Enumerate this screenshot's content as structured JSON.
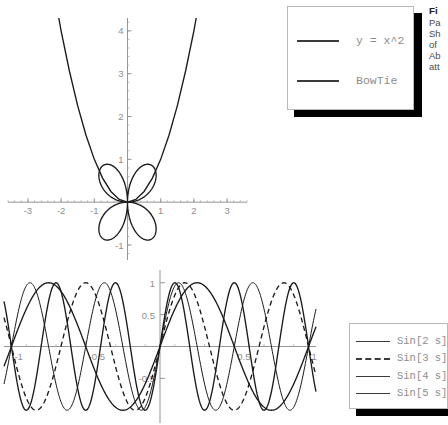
{
  "document": {
    "background_color": "#ffffff",
    "axis_color": "#8a8a8a",
    "curve_color": "#1a1a1a",
    "label_color": "#8d8d8d"
  },
  "caption": {
    "title": "Fi",
    "lines": [
      "Pa",
      "Sh",
      "of",
      "Ab",
      "att"
    ]
  },
  "legends": {
    "top": {
      "entries": [
        {
          "label": "y = x^2",
          "style": "solid"
        },
        {
          "label": "BowTie",
          "style": "solid"
        }
      ]
    },
    "bottom": {
      "entries": [
        {
          "label": "Sin[2 s]",
          "style": "solid"
        },
        {
          "label": "Sin[3 s]",
          "style": "dashed"
        },
        {
          "label": "Sin[4 s]",
          "style": "thin"
        },
        {
          "label": "Sin[5 s]",
          "style": "solid"
        }
      ]
    }
  },
  "chart_data": [
    {
      "id": "plot-parabola-bowtie",
      "type": "line",
      "title": "",
      "xlabel": "",
      "ylabel": "",
      "xlim": [
        -3.6,
        3.6
      ],
      "ylim": [
        -1.35,
        4.3
      ],
      "grid": false,
      "legend_position": "right",
      "xticks": [
        -3,
        -2,
        -1,
        1,
        2,
        3
      ],
      "xtick_labels": [
        "-3",
        "-2",
        "-1",
        "1",
        "2",
        "3"
      ],
      "yticks": [
        -1,
        1,
        2,
        3,
        4
      ],
      "ytick_labels": [
        "-1",
        "1",
        "2",
        "3",
        "4"
      ],
      "series": [
        {
          "name": "y = x^2",
          "style": "solid",
          "equation": "y = x^2",
          "points": [
            [
              -2.07,
              4.3
            ],
            [
              -2.0,
              4.0
            ],
            [
              -1.75,
              3.0625
            ],
            [
              -1.5,
              2.25
            ],
            [
              -1.25,
              1.5625
            ],
            [
              -1.0,
              1.0
            ],
            [
              -0.75,
              0.5625
            ],
            [
              -0.5,
              0.25
            ],
            [
              -0.25,
              0.0625
            ],
            [
              0.0,
              0.0
            ],
            [
              0.25,
              0.0625
            ],
            [
              0.5,
              0.25
            ],
            [
              0.75,
              0.5625
            ],
            [
              1.0,
              1.0
            ],
            [
              1.25,
              1.5625
            ],
            [
              1.5,
              2.25
            ],
            [
              1.75,
              3.0625
            ],
            [
              2.0,
              4.0
            ],
            [
              2.07,
              4.3
            ]
          ]
        },
        {
          "name": "BowTie",
          "style": "solid",
          "description": "four-lobed rose-like closed curve centred on origin, lobes reaching x=+/-1.1 and y=+/-1.15",
          "parametric": "r = sin(2t) style four-petal figure"
        }
      ]
    },
    {
      "id": "plot-sin-family",
      "type": "line",
      "title": "",
      "xlabel": "",
      "ylabel": "",
      "xlim": [
        -1.05,
        1.05
      ],
      "ylim": [
        -1.2,
        1.2
      ],
      "grid": false,
      "legend_position": "right",
      "xticks": [
        -1,
        -0.5,
        0.5,
        1
      ],
      "xtick_labels": [
        "-1",
        "-0.5",
        "0.5",
        "1"
      ],
      "yticks": [
        -0.5,
        0.5,
        1
      ],
      "ytick_labels": [
        "-0.5",
        "0.5",
        "1"
      ],
      "series": [
        {
          "name": "Sin[2 s]",
          "style": "solid",
          "frequency": 2,
          "equation": "sin(2*pi*s)"
        },
        {
          "name": "Sin[3 s]",
          "style": "dashed",
          "frequency": 3,
          "equation": "sin(3*pi*s)"
        },
        {
          "name": "Sin[4 s]",
          "style": "thin",
          "frequency": 4,
          "equation": "sin(4*pi*s)"
        },
        {
          "name": "Sin[5 s]",
          "style": "solid",
          "frequency": 5,
          "equation": "sin(5*pi*s)"
        }
      ]
    }
  ]
}
